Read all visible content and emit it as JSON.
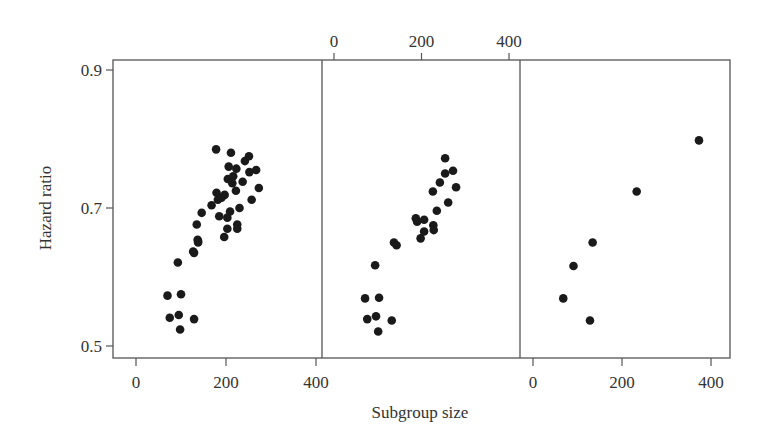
{
  "chart_data": {
    "type": "scatter",
    "title": "",
    "xlabel": "Subgroup size",
    "ylabel": "Hazard ratio",
    "ylim": [
      0.5,
      0.9
    ],
    "yticks": [
      0.5,
      0.7,
      0.9
    ],
    "ytick_labels": [
      "0.5",
      "0.7",
      "0.9"
    ],
    "grid": false,
    "legend": null,
    "layout": "three side-by-side panels sharing y axis; x axes alternate bottom/top/bottom",
    "panels": [
      {
        "name": "panel-1",
        "xaxis_position": "bottom",
        "xlim": [
          -50,
          420
        ],
        "xticks": [
          0,
          200,
          400
        ],
        "xtick_labels": [
          "0",
          "200",
          "400"
        ],
        "points": [
          {
            "x": 178,
            "y": 0.785
          },
          {
            "x": 211,
            "y": 0.78
          },
          {
            "x": 251,
            "y": 0.775
          },
          {
            "x": 242,
            "y": 0.768
          },
          {
            "x": 206,
            "y": 0.76
          },
          {
            "x": 223,
            "y": 0.757
          },
          {
            "x": 252,
            "y": 0.752
          },
          {
            "x": 267,
            "y": 0.755
          },
          {
            "x": 204,
            "y": 0.742
          },
          {
            "x": 216,
            "y": 0.746
          },
          {
            "x": 237,
            "y": 0.738
          },
          {
            "x": 214,
            "y": 0.736
          },
          {
            "x": 222,
            "y": 0.725
          },
          {
            "x": 273,
            "y": 0.729
          },
          {
            "x": 179,
            "y": 0.722
          },
          {
            "x": 197,
            "y": 0.719
          },
          {
            "x": 190,
            "y": 0.715
          },
          {
            "x": 182,
            "y": 0.712
          },
          {
            "x": 257,
            "y": 0.712
          },
          {
            "x": 168,
            "y": 0.704
          },
          {
            "x": 146,
            "y": 0.693
          },
          {
            "x": 209,
            "y": 0.695
          },
          {
            "x": 230,
            "y": 0.7
          },
          {
            "x": 185,
            "y": 0.688
          },
          {
            "x": 203,
            "y": 0.686
          },
          {
            "x": 135,
            "y": 0.676
          },
          {
            "x": 225,
            "y": 0.676
          },
          {
            "x": 225,
            "y": 0.67
          },
          {
            "x": 203,
            "y": 0.67
          },
          {
            "x": 196,
            "y": 0.658
          },
          {
            "x": 137,
            "y": 0.654
          },
          {
            "x": 138,
            "y": 0.65
          },
          {
            "x": 127,
            "y": 0.637
          },
          {
            "x": 138,
            "y": 0.652
          },
          {
            "x": 129,
            "y": 0.635
          },
          {
            "x": 93,
            "y": 0.621
          },
          {
            "x": 70,
            "y": 0.573
          },
          {
            "x": 100,
            "y": 0.575
          },
          {
            "x": 75,
            "y": 0.541
          },
          {
            "x": 95,
            "y": 0.545
          },
          {
            "x": 129,
            "y": 0.539
          },
          {
            "x": 98,
            "y": 0.524
          }
        ]
      },
      {
        "name": "panel-2",
        "xaxis_position": "top",
        "xlim": [
          -27,
          425
        ],
        "xticks": [
          0,
          200,
          400
        ],
        "xtick_labels": [
          "0",
          "200",
          "400"
        ],
        "points": [
          {
            "x": 254,
            "y": 0.772
          },
          {
            "x": 254,
            "y": 0.75
          },
          {
            "x": 272,
            "y": 0.754
          },
          {
            "x": 242,
            "y": 0.737
          },
          {
            "x": 279,
            "y": 0.73
          },
          {
            "x": 226,
            "y": 0.724
          },
          {
            "x": 261,
            "y": 0.708
          },
          {
            "x": 235,
            "y": 0.696
          },
          {
            "x": 187,
            "y": 0.685
          },
          {
            "x": 206,
            "y": 0.683
          },
          {
            "x": 190,
            "y": 0.68
          },
          {
            "x": 227,
            "y": 0.675
          },
          {
            "x": 228,
            "y": 0.668
          },
          {
            "x": 206,
            "y": 0.666
          },
          {
            "x": 198,
            "y": 0.656
          },
          {
            "x": 137,
            "y": 0.65
          },
          {
            "x": 143,
            "y": 0.646
          },
          {
            "x": 94,
            "y": 0.617
          },
          {
            "x": 71,
            "y": 0.569
          },
          {
            "x": 103,
            "y": 0.57
          },
          {
            "x": 76,
            "y": 0.539
          },
          {
            "x": 96,
            "y": 0.543
          },
          {
            "x": 132,
            "y": 0.537
          },
          {
            "x": 101,
            "y": 0.521
          }
        ]
      },
      {
        "name": "panel-3",
        "xaxis_position": "bottom",
        "xlim": [
          -30,
          442
        ],
        "xticks": [
          0,
          200,
          400
        ],
        "xtick_labels": [
          "0",
          "200",
          "400"
        ],
        "points": [
          {
            "x": 373,
            "y": 0.798
          },
          {
            "x": 233,
            "y": 0.724
          },
          {
            "x": 134,
            "y": 0.65
          },
          {
            "x": 91,
            "y": 0.616
          },
          {
            "x": 68,
            "y": 0.569
          },
          {
            "x": 128,
            "y": 0.537
          }
        ]
      }
    ]
  },
  "layout_px": {
    "frame": {
      "left": 113,
      "right": 730,
      "top": 60,
      "bottom": 358
    },
    "panel_dividers": [
      322,
      520
    ],
    "y_map": {
      "v0": 0.9,
      "p0": 70,
      "v1": 0.5,
      "p1": 346
    },
    "x_maps": [
      {
        "v0": 0,
        "p0": 136,
        "v1": 400,
        "p1": 316
      },
      {
        "v0": 0,
        "p0": 334,
        "v1": 400,
        "p1": 509
      },
      {
        "v0": 0,
        "p0": 533,
        "v1": 400,
        "p1": 711
      }
    ]
  },
  "colors": {
    "axis": "#555555",
    "point": "#1a1a1a",
    "text": "#333333"
  }
}
